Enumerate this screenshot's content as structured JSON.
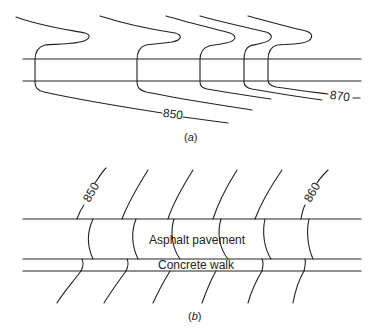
{
  "figure_a": {
    "caption_open": "(",
    "caption_letter": "a",
    "caption_close": ")",
    "contour_labels": {
      "left": "850",
      "right": "870"
    },
    "contour_count": 5
  },
  "figure_b": {
    "caption_open": "(",
    "caption_letter": "b",
    "caption_close": ")",
    "contour_labels": {
      "left": "850",
      "right": "860"
    },
    "contour_count": 6,
    "regions": {
      "pavement": "Asphalt pavement",
      "walk": "Concrete walk"
    }
  },
  "colors": {
    "line": "#222222",
    "background": "#ffffff"
  }
}
